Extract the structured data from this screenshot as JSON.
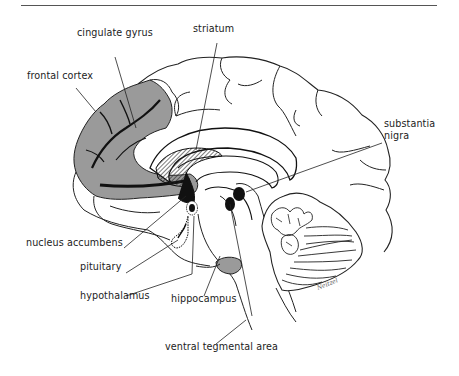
{
  "figure": {
    "type": "sagittal brain section",
    "labels": {
      "cingulate_gyrus": "cingulate gyrus",
      "striatum": "striatum",
      "frontal_cortex": "frontal cortex",
      "substantia_nigra_line1": "substantia",
      "substantia_nigra_line2": "nigra",
      "nucleus_accumbens": "nucleus accumbens",
      "pituitary": "pituitary",
      "hypothalamus": "hypothalamus",
      "hippocampus": "hippocampus",
      "ventral_tegmental_area": "ventral tegmental area"
    },
    "signature": "Neitzel",
    "colors": {
      "shaded_region": "#9a9a9a",
      "outline": "#222222",
      "dark_fill": "#1a1a1a",
      "background": "#ffffff"
    }
  }
}
